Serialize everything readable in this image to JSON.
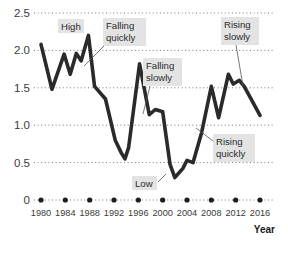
{
  "chart_data": {
    "type": "line",
    "title": "",
    "subtitle": "",
    "xlabel": "Year",
    "ylabel": "",
    "xlim": [
      1980,
      2016
    ],
    "ylim": [
      0,
      2.5
    ],
    "grid": true,
    "grid_orientation": "horizontal",
    "legend": "none",
    "y_ticks": [
      "2.5",
      "2.0",
      "1.5",
      "1.0",
      "0.5",
      "0"
    ],
    "y_tick_values": [
      2.5,
      2.0,
      1.5,
      1.0,
      0.5,
      0
    ],
    "x_ticks": [
      "1980",
      "1984",
      "1988",
      "1992",
      "1996",
      "2000",
      "2004",
      "2008",
      "2012",
      "2016"
    ],
    "x_tick_values": [
      1980,
      1984,
      1988,
      1992,
      1996,
      2000,
      2004,
      2008,
      2012,
      2016
    ],
    "x_tick_marker": "dot",
    "series": [
      {
        "name": "value",
        "color": "#2a2a2a",
        "x": [
          1980.0,
          1981.8,
          1983.8,
          1984.8,
          1985.8,
          1986.6,
          1987.8,
          1988.8,
          1990.6,
          1992.2,
          1993.2,
          1993.8,
          1994.4,
          1996.2,
          1997.8,
          1998.8,
          2000.0,
          2001.2,
          2002.0,
          2003.3,
          2004.0,
          2005.0,
          2006.4,
          2008.0,
          2009.2,
          2010.8,
          2011.6,
          2012.6,
          2013.4,
          2016.0
        ],
        "y": [
          2.08,
          1.48,
          1.95,
          1.68,
          1.96,
          1.86,
          2.2,
          1.52,
          1.35,
          0.8,
          0.63,
          0.55,
          0.7,
          1.82,
          1.14,
          1.21,
          1.18,
          0.48,
          0.3,
          0.42,
          0.53,
          0.5,
          0.9,
          1.52,
          1.1,
          1.68,
          1.55,
          1.6,
          1.52,
          1.13
        ]
      }
    ],
    "annotations": [
      {
        "id": "high",
        "label": "High",
        "lines": [
          "High"
        ],
        "box_x": 58,
        "box_y": 19,
        "box_w": 26,
        "box_h": 14,
        "leader": null
      },
      {
        "id": "falling-quickly",
        "label": "Falling quickly",
        "lines": [
          "Falling",
          "quickly"
        ],
        "box_x": 103,
        "box_y": 18,
        "box_w": 43,
        "box_h": 28,
        "leader": [
          104,
          46,
          84,
          66
        ]
      },
      {
        "id": "falling-slowly",
        "label": "Falling slowly",
        "lines": [
          "Falling",
          "slowly"
        ],
        "box_x": 143,
        "box_y": 58,
        "box_w": 39,
        "box_h": 28,
        "leader": [
          150,
          86,
          143,
          114
        ]
      },
      {
        "id": "rising-slowly",
        "label": "Rising slowly",
        "lines": [
          "Rising",
          "slowly"
        ],
        "box_x": 221,
        "box_y": 17,
        "box_w": 38,
        "box_h": 28,
        "leader": [
          236,
          45,
          243,
          86
        ]
      },
      {
        "id": "rising-quickly",
        "label": "Rising quickly",
        "lines": [
          "Rising",
          "quickly"
        ],
        "box_x": 213,
        "box_y": 134,
        "box_w": 42,
        "box_h": 28,
        "leader": [
          213,
          141,
          196,
          128
        ]
      },
      {
        "id": "low",
        "label": "Low",
        "lines": [
          "Low"
        ],
        "box_x": 132,
        "box_y": 176,
        "box_w": 25,
        "box_h": 14,
        "leader": [
          158,
          182,
          166,
          174
        ]
      }
    ]
  },
  "axis": {
    "x_title": "Year"
  },
  "geometry": {
    "plot_left": 41,
    "plot_right": 260,
    "y_zero_px": 200,
    "y_top_px": 13,
    "grid_px": [
      13,
      50,
      88,
      126,
      163,
      200
    ],
    "grid_x_start": 34,
    "grid_x_end": 275
  }
}
